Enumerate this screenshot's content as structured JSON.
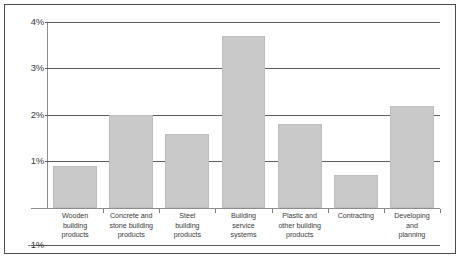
{
  "chart_data": {
    "type": "bar",
    "title": "",
    "xlabel": "",
    "ylabel": "",
    "ylim": [
      -1,
      4
    ],
    "grid": true,
    "legend": "none",
    "y_ticks": [
      "4%",
      "3%",
      "2%",
      "1%",
      "-1%"
    ],
    "y_tick_values": [
      4,
      3,
      2,
      1,
      -1
    ],
    "bar_color": "#c9c9c9",
    "categories": [
      "Wooden building products",
      "Concrete and stone building products",
      "Steel building products",
      "Building service systems",
      "Plastic and other building products",
      "Contracting",
      "Developing and planning"
    ],
    "category_lines": [
      [
        "Wooden",
        "building",
        "products"
      ],
      [
        "Concrete and",
        "stone building",
        "products"
      ],
      [
        "Steel",
        "building",
        "products"
      ],
      [
        "Building",
        "service",
        "systems"
      ],
      [
        "Plastic and",
        "other building",
        "products"
      ],
      [
        "Contracting"
      ],
      [
        "Developing",
        "and",
        "planning"
      ]
    ],
    "values": [
      0.9,
      2.0,
      1.6,
      3.7,
      1.8,
      0.7,
      2.2
    ],
    "value_unit": "%"
  },
  "axis": {
    "tick_4": "4%",
    "tick_3": "3%",
    "tick_2": "2%",
    "tick_1": "1%",
    "tick_neg1": "-1%"
  }
}
